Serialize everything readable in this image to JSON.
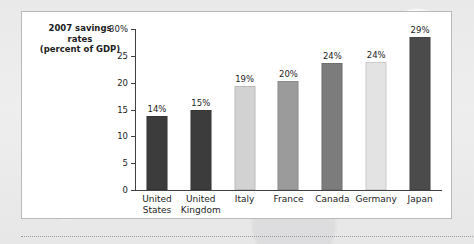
{
  "chart_data": {
    "type": "bar",
    "title": "2007 savings rates (percent of GDP)",
    "title_lines": [
      "2007 savings",
      "rates",
      "(percent of GDP)"
    ],
    "xlabel": "",
    "ylabel": "",
    "ylim": [
      0,
      30
    ],
    "grid": false,
    "legend": null,
    "y_ticks": [
      {
        "value": 30,
        "label": "30%"
      },
      {
        "value": 25,
        "label": "25"
      },
      {
        "value": 20,
        "label": "20"
      },
      {
        "value": 15,
        "label": "15"
      },
      {
        "value": 10,
        "label": "10"
      },
      {
        "value": 5,
        "label": "5"
      },
      {
        "value": 0,
        "label": "0"
      }
    ],
    "categories": [
      "United States",
      "United Kingdom",
      "Italy",
      "France",
      "Canada",
      "Germany",
      "Japan"
    ],
    "category_lines": [
      [
        "United",
        "States"
      ],
      [
        "United",
        "Kingdom"
      ],
      [
        "Italy"
      ],
      [
        "France"
      ],
      [
        "Canada"
      ],
      [
        "Germany"
      ],
      [
        "Japan"
      ]
    ],
    "values": [
      13.7,
      14.9,
      19.3,
      20.4,
      23.7,
      23.9,
      28.5
    ],
    "data_labels": [
      "14%",
      "15%",
      "19%",
      "20%",
      "24%",
      "24%",
      "29%"
    ],
    "bar_colors": [
      "#3c3c3c",
      "#3c3c3c",
      "#d2d2d2",
      "#9b9b9b",
      "#7c7c7c",
      "#e3e3e3",
      "#4b4b4b"
    ]
  },
  "figure": {
    "panel_background": "#ffffff",
    "panel_border_color": "#b9b9bb",
    "outer_background": "#ececed",
    "axis_color": "#414141",
    "text_color": "#1d1d1d"
  }
}
